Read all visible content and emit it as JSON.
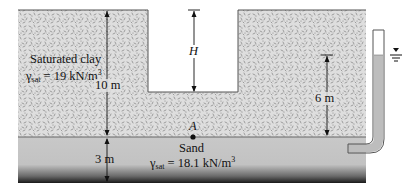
{
  "figure": {
    "layers": {
      "clay": {
        "name": "Saturated clay",
        "unit_weight_symbol": "γ",
        "unit_weight_subscript": "sat",
        "unit_weight_value": "= 19 kN/m",
        "unit_weight_exp": "3",
        "fill_color": "#dcdcdc"
      },
      "sand": {
        "name": "Sand",
        "unit_weight_symbol": "γ",
        "unit_weight_subscript": "sat",
        "unit_weight_value": "= 18.1 kN/m",
        "unit_weight_exp": "3",
        "fill_color": "#c4c4c4"
      }
    },
    "dimensions": {
      "clay_thickness": "10 m",
      "excavation_depth": "H",
      "piezometric_height": "6 m",
      "sand_thickness": "3 m"
    },
    "point": {
      "label": "A"
    },
    "water_table_symbol": "▼"
  }
}
